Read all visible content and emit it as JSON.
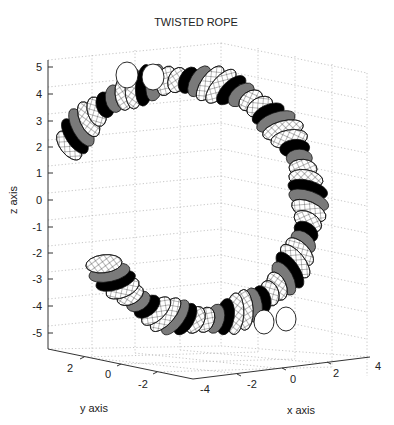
{
  "chart_data": {
    "type": "surface3d",
    "title": "TWISTED ROPE",
    "xlabel": "x axis",
    "ylabel": "y axis",
    "zlabel": "z axis",
    "xlim": [
      -4,
      4
    ],
    "ylim": [
      -3,
      3
    ],
    "zlim": [
      -5,
      5
    ],
    "xticks": [
      "-4",
      "-2",
      "0",
      "2",
      "4"
    ],
    "yticks": [
      "2",
      "0",
      "-2"
    ],
    "zticks": [
      "5",
      "4",
      "3",
      "2",
      "1",
      "0",
      "-1",
      "-2",
      "-3",
      "-4",
      "-5"
    ],
    "grid": true,
    "colormap": "gray",
    "surface": {
      "shape": "twisted double tube",
      "z_range": [
        -4.5,
        4.5
      ],
      "end_caps": [
        "top-left (z≈4)",
        "bottom-right (z≈-4.5)"
      ],
      "shading": [
        "black",
        "gray",
        "white"
      ]
    }
  }
}
